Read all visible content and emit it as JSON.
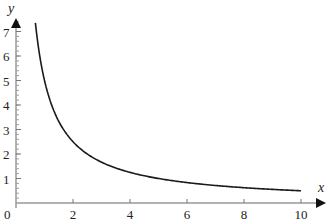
{
  "chart_data": {
    "type": "line",
    "title": "",
    "xlabel": "x",
    "ylabel": "y",
    "xlim": [
      0,
      10.5
    ],
    "ylim": [
      0,
      7.6
    ],
    "x_ticks": [
      0,
      2,
      4,
      6,
      8,
      10
    ],
    "y_ticks": [
      1,
      2,
      3,
      4,
      5,
      6,
      7
    ],
    "y_minor_step": 0.2,
    "grid": false,
    "legend": null,
    "series": [
      {
        "name": "y = 5/x",
        "color": "#1a1a1a",
        "x": [
          0.68,
          0.8,
          1,
          1.25,
          1.5,
          2,
          2.5,
          3,
          4,
          5,
          6,
          7,
          8,
          9,
          10
        ],
        "values": [
          7.35,
          6.25,
          5.0,
          4.0,
          3.33,
          2.5,
          2.0,
          1.67,
          1.25,
          1.0,
          0.83,
          0.71,
          0.63,
          0.56,
          0.5
        ]
      }
    ]
  },
  "labels": {
    "x_axis": "x",
    "y_axis": "y",
    "origin": "0",
    "x_tick_labels": [
      "2",
      "4",
      "6",
      "8",
      "10"
    ],
    "y_tick_labels": [
      "1",
      "2",
      "3",
      "4",
      "5",
      "6",
      "7"
    ]
  }
}
